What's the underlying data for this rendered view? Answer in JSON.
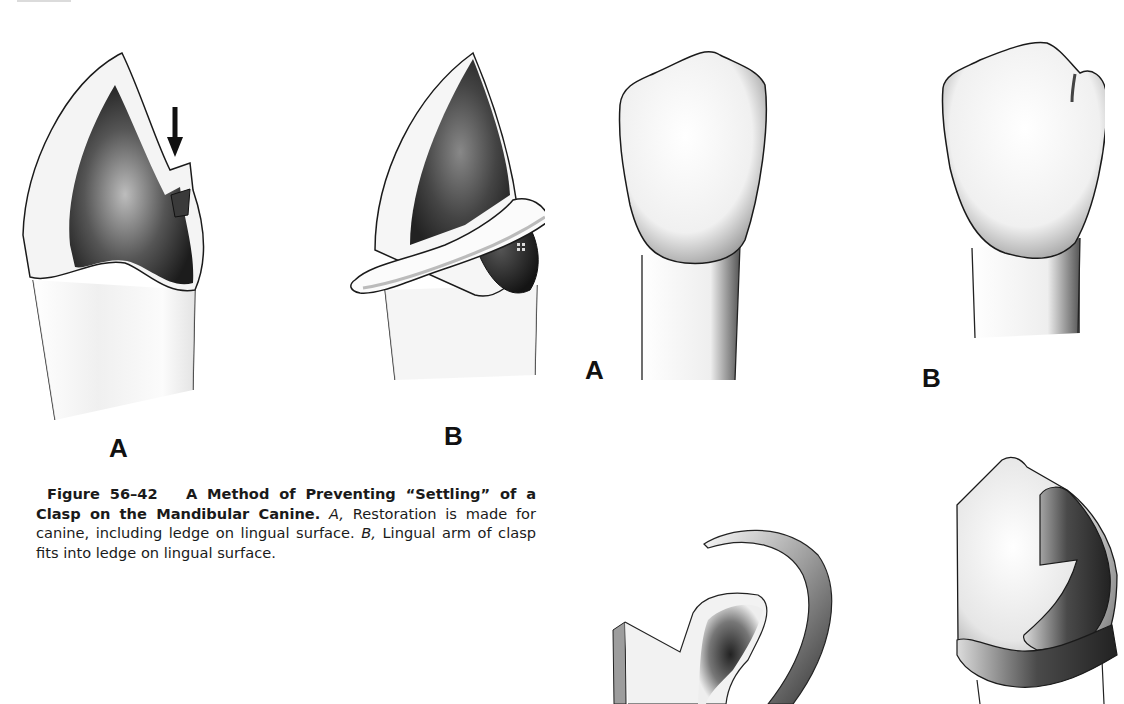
{
  "page": {
    "header_fragment": "partial page header (cropped)"
  },
  "figure_56_42": {
    "panels": [
      {
        "label": "A",
        "description": "Mandibular canine restoration with ledge on lingual surface; arrow pointing to ledge"
      },
      {
        "label": "B",
        "description": "Lingual arm of clasp seated in ledge on lingual surface"
      }
    ],
    "caption": {
      "number": "Figure 56–42",
      "title": "A Method of Preventing “Settling” of a Clasp on the Mandibular Canine.",
      "ref_a": "A,",
      "text_a": " Restoration is made for canine, including ledge on lingual surface. ",
      "ref_b": "B,",
      "text_b": " Lingual arm of clasp fits into ledge on lingual surface."
    }
  },
  "figure_right_top": {
    "panels": [
      {
        "label": "A",
        "description": "Incisor crown, labial view"
      },
      {
        "label": "B",
        "description": "Incisor crown with notch/rest seat at incisal corner"
      }
    ]
  },
  "figure_right_bottom": {
    "panels": [
      {
        "description": "Clasp arm curving over tooth with rest (cropped)"
      },
      {
        "description": "Crown with clasp ledge and band (cropped)"
      }
    ]
  },
  "colors": {
    "ink": "#111111",
    "shade_dark": "#2a2a2a",
    "shade_mid": "#7a7a7a",
    "paper": "#ffffff"
  }
}
